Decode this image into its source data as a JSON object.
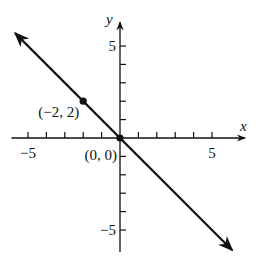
{
  "chart_data": {
    "type": "line",
    "title": "",
    "xlabel": "x",
    "ylabel": "y",
    "xlim": [
      -5.9,
      6.8
    ],
    "ylim": [
      -6.2,
      6.3
    ],
    "grid": false,
    "x_ticks": [
      -5,
      -4,
      -3,
      -2,
      -1,
      1,
      2,
      3,
      4,
      5
    ],
    "y_ticks": [
      -5,
      -4,
      -3,
      -2,
      -1,
      1,
      2,
      3,
      4,
      5
    ],
    "x_tick_labels": [
      {
        "value": -5,
        "label": "−5"
      },
      {
        "value": 5,
        "label": "5"
      }
    ],
    "y_tick_labels": [
      {
        "value": 5,
        "label": "5"
      },
      {
        "value": -5,
        "label": "−5"
      }
    ],
    "series": [
      {
        "name": "y = -x",
        "equation": "y = -x",
        "x": [
          -5.7,
          6.1
        ],
        "y": [
          5.7,
          -6.1
        ],
        "arrows_both_ends": true,
        "color": "#111111"
      }
    ],
    "points": [
      {
        "x": -2,
        "y": 2,
        "label": "(−2, 2)"
      },
      {
        "x": 0,
        "y": 0,
        "label": "(0, 0)"
      }
    ]
  },
  "layout": {
    "origin_px": [
      120,
      138
    ],
    "unit_px": 18.4,
    "axis_color": "#111111",
    "line_color": "#111111"
  }
}
